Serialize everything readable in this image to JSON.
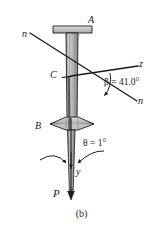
{
  "figure": {
    "caption": "(b)",
    "type": "engineering-free-body-diagram"
  },
  "labels": {
    "point_a": "A",
    "point_b": "B",
    "centroid_c": "C",
    "axis_n_upper": "n",
    "axis_n_lower": "n",
    "axis_z": "z",
    "axis_y": "y",
    "load_p": "P"
  },
  "annotations": {
    "beta": {
      "symbol": "β",
      "equals": "=",
      "value": "41.0",
      "unit": "°",
      "full": "β = 41.0°"
    },
    "theta": {
      "symbol": "θ",
      "equals": "=",
      "value": "1",
      "unit": "°",
      "full": "θ = 1°"
    }
  },
  "colors": {
    "line": "#1a1a1a",
    "beam_fill": "#bdbdbd",
    "beam_fill_light": "#d6d6d6",
    "beam_web": "#9a9a9a",
    "background": "#ffffff",
    "text": "#1a1a1a"
  },
  "geometry": {
    "centroid": {
      "x": 71,
      "y": 76
    },
    "n_axis_start": {
      "x": 30,
      "y": 33
    },
    "n_axis_end": {
      "x": 137,
      "y": 101
    },
    "z_axis_end": {
      "x": 139,
      "y": 66
    },
    "y_axis_end": {
      "x": 71,
      "y": 200
    },
    "beta_degrees": 41.0,
    "theta_degrees": 1
  }
}
